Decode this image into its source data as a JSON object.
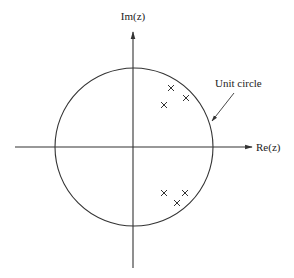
{
  "diagram": {
    "axes": {
      "x_label": "Re(z)",
      "y_label": "Im(z)"
    },
    "annotations": {
      "unit_circle_label": "Unit circle"
    },
    "poles": [
      {
        "re": 0.47,
        "im": 0.75
      },
      {
        "re": 0.66,
        "im": 0.62
      },
      {
        "re": 0.38,
        "im": 0.53
      },
      {
        "re": 0.38,
        "im": -0.58
      },
      {
        "re": 0.65,
        "im": -0.58
      },
      {
        "re": 0.55,
        "im": -0.71
      }
    ],
    "colors": {
      "stroke": "#333333",
      "text": "#222222",
      "background": "#ffffff"
    }
  }
}
